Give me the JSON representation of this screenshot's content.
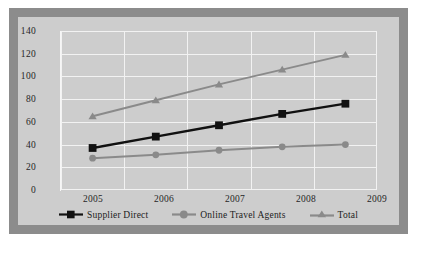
{
  "chart_data": {
    "type": "line",
    "title": "",
    "subtitle": "",
    "xlabel": "",
    "ylabel": "",
    "categories": [
      "2005",
      "2006",
      "2007",
      "2008",
      "2009"
    ],
    "ylim": [
      0,
      140
    ],
    "yticks": [
      0,
      20,
      40,
      60,
      80,
      100,
      120,
      140
    ],
    "ytick_labels": [
      "0",
      "20",
      "40",
      "60",
      "80",
      "100",
      "120",
      "140"
    ],
    "grid": true,
    "legend_position": "bottom",
    "series": [
      {
        "name": "Supplier Direct",
        "values": [
          37,
          47,
          57,
          67,
          76
        ],
        "color": "#111111",
        "marker": "square"
      },
      {
        "name": "Online Travel Agents",
        "values": [
          28,
          31,
          35,
          38,
          40
        ],
        "color": "#8a8a8a",
        "marker": "circle"
      },
      {
        "name": "Total",
        "values": [
          65,
          79,
          93,
          106,
          119
        ],
        "color": "#8a8a8a",
        "marker": "triangle"
      }
    ]
  },
  "colors": {
    "frame": "#8c8c8c",
    "plot_background": "#cdcdcd",
    "gridline": "#f2f2f2",
    "text": "#262626"
  }
}
